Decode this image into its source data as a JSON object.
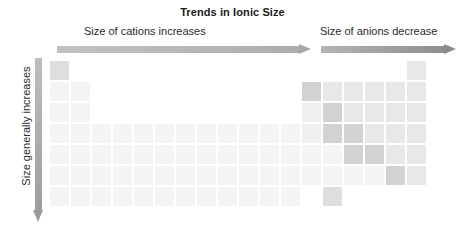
{
  "figure": {
    "title": "Trends in Ionic Size",
    "width": 465,
    "height": 242
  },
  "annotations": {
    "cations_label": "Size of cations increases",
    "anions_label": "Size of anions decrease",
    "vertical_label": "Size generally increases"
  },
  "arrows": [
    {
      "name": "cations-arrow",
      "direction": "right",
      "color_start": "#c2c2c2",
      "color_end": "#a8a8a8"
    },
    {
      "name": "anions-arrow",
      "direction": "right",
      "color_start": "#b4b4b4",
      "color_end": "#8a8a8a"
    },
    {
      "name": "vertical-arrow",
      "direction": "down",
      "color_start": "#bdbdbd",
      "color_end": "#9a9a9a"
    }
  ],
  "colors": {
    "background": "#ffffff",
    "text": "#2b2b2b",
    "title": "#1a1a1a",
    "cell_faint": "#f7f7f7",
    "cell_light": "#f0f0f0",
    "cell_mid": "#e4e4e4",
    "cell_dark": "#d2d2d2",
    "cell_darker": "#c8c8c8"
  },
  "chart_data": {
    "type": "heatmap",
    "title": "Trends in Ionic Size",
    "xlabel": "",
    "ylabel": "",
    "grid": false,
    "legend_position": "none",
    "columns": 18,
    "rows": 7,
    "cell_size_px": 19,
    "cell_gap_px": 2,
    "shade_scale": {
      "0": "#f9f9f9",
      "1": "#f4f4f4",
      "2": "#efefef",
      "3": "#e8e8e8",
      "4": "#dedede",
      "5": "#d2d2d2",
      "6": "#c6c6c6"
    },
    "cells": [
      {
        "row": 1,
        "col": 1,
        "shade": 4
      },
      {
        "row": 1,
        "col": 18,
        "shade": 3
      },
      {
        "row": 2,
        "col": 1,
        "shade": 1
      },
      {
        "row": 2,
        "col": 2,
        "shade": 1
      },
      {
        "row": 2,
        "col": 13,
        "shade": 5
      },
      {
        "row": 2,
        "col": 14,
        "shade": 3
      },
      {
        "row": 2,
        "col": 15,
        "shade": 3
      },
      {
        "row": 2,
        "col": 16,
        "shade": 3
      },
      {
        "row": 2,
        "col": 17,
        "shade": 3
      },
      {
        "row": 2,
        "col": 18,
        "shade": 3
      },
      {
        "row": 3,
        "col": 1,
        "shade": 1
      },
      {
        "row": 3,
        "col": 2,
        "shade": 1
      },
      {
        "row": 3,
        "col": 13,
        "shade": 2
      },
      {
        "row": 3,
        "col": 14,
        "shade": 5
      },
      {
        "row": 3,
        "col": 15,
        "shade": 3
      },
      {
        "row": 3,
        "col": 16,
        "shade": 3
      },
      {
        "row": 3,
        "col": 17,
        "shade": 3
      },
      {
        "row": 3,
        "col": 18,
        "shade": 3
      },
      {
        "row": 4,
        "col": 1,
        "shade": 1
      },
      {
        "row": 4,
        "col": 2,
        "shade": 1
      },
      {
        "row": 4,
        "col": 3,
        "shade": 1
      },
      {
        "row": 4,
        "col": 4,
        "shade": 1
      },
      {
        "row": 4,
        "col": 5,
        "shade": 1
      },
      {
        "row": 4,
        "col": 6,
        "shade": 1
      },
      {
        "row": 4,
        "col": 7,
        "shade": 1
      },
      {
        "row": 4,
        "col": 8,
        "shade": 1
      },
      {
        "row": 4,
        "col": 9,
        "shade": 1
      },
      {
        "row": 4,
        "col": 10,
        "shade": 1
      },
      {
        "row": 4,
        "col": 11,
        "shade": 1
      },
      {
        "row": 4,
        "col": 12,
        "shade": 1
      },
      {
        "row": 4,
        "col": 13,
        "shade": 2
      },
      {
        "row": 4,
        "col": 14,
        "shade": 5
      },
      {
        "row": 4,
        "col": 15,
        "shade": 5
      },
      {
        "row": 4,
        "col": 16,
        "shade": 3
      },
      {
        "row": 4,
        "col": 17,
        "shade": 3
      },
      {
        "row": 4,
        "col": 18,
        "shade": 3
      },
      {
        "row": 5,
        "col": 1,
        "shade": 1
      },
      {
        "row": 5,
        "col": 2,
        "shade": 1
      },
      {
        "row": 5,
        "col": 3,
        "shade": 1
      },
      {
        "row": 5,
        "col": 4,
        "shade": 1
      },
      {
        "row": 5,
        "col": 5,
        "shade": 1
      },
      {
        "row": 5,
        "col": 6,
        "shade": 1
      },
      {
        "row": 5,
        "col": 7,
        "shade": 1
      },
      {
        "row": 5,
        "col": 8,
        "shade": 1
      },
      {
        "row": 5,
        "col": 9,
        "shade": 1
      },
      {
        "row": 5,
        "col": 10,
        "shade": 1
      },
      {
        "row": 5,
        "col": 11,
        "shade": 1
      },
      {
        "row": 5,
        "col": 12,
        "shade": 1
      },
      {
        "row": 5,
        "col": 13,
        "shade": 1
      },
      {
        "row": 5,
        "col": 14,
        "shade": 1
      },
      {
        "row": 5,
        "col": 15,
        "shade": 5
      },
      {
        "row": 5,
        "col": 16,
        "shade": 5
      },
      {
        "row": 5,
        "col": 17,
        "shade": 3
      },
      {
        "row": 5,
        "col": 18,
        "shade": 3
      },
      {
        "row": 6,
        "col": 1,
        "shade": 1
      },
      {
        "row": 6,
        "col": 2,
        "shade": 1
      },
      {
        "row": 6,
        "col": 3,
        "shade": 1
      },
      {
        "row": 6,
        "col": 4,
        "shade": 1
      },
      {
        "row": 6,
        "col": 5,
        "shade": 1
      },
      {
        "row": 6,
        "col": 6,
        "shade": 1
      },
      {
        "row": 6,
        "col": 7,
        "shade": 1
      },
      {
        "row": 6,
        "col": 8,
        "shade": 1
      },
      {
        "row": 6,
        "col": 9,
        "shade": 1
      },
      {
        "row": 6,
        "col": 10,
        "shade": 1
      },
      {
        "row": 6,
        "col": 11,
        "shade": 1
      },
      {
        "row": 6,
        "col": 12,
        "shade": 1
      },
      {
        "row": 6,
        "col": 13,
        "shade": 1
      },
      {
        "row": 6,
        "col": 14,
        "shade": 1
      },
      {
        "row": 6,
        "col": 15,
        "shade": 1
      },
      {
        "row": 6,
        "col": 16,
        "shade": 1
      },
      {
        "row": 6,
        "col": 17,
        "shade": 5
      },
      {
        "row": 6,
        "col": 18,
        "shade": 3
      },
      {
        "row": 7,
        "col": 1,
        "shade": 1
      },
      {
        "row": 7,
        "col": 2,
        "shade": 1
      },
      {
        "row": 7,
        "col": 3,
        "shade": 1
      },
      {
        "row": 7,
        "col": 4,
        "shade": 1
      },
      {
        "row": 7,
        "col": 5,
        "shade": 1
      },
      {
        "row": 7,
        "col": 6,
        "shade": 1
      },
      {
        "row": 7,
        "col": 7,
        "shade": 1
      },
      {
        "row": 7,
        "col": 8,
        "shade": 1
      },
      {
        "row": 7,
        "col": 9,
        "shade": 1
      },
      {
        "row": 7,
        "col": 10,
        "shade": 1
      },
      {
        "row": 7,
        "col": 11,
        "shade": 1
      },
      {
        "row": 7,
        "col": 12,
        "shade": 1
      },
      {
        "row": 7,
        "col": 14,
        "shade": 4
      }
    ]
  }
}
